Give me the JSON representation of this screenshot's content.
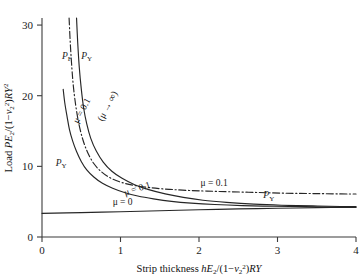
{
  "chart_data": {
    "type": "line",
    "title": "",
    "xlabel": "Strip thickness hE2/(1−ν2²)RY",
    "ylabel": "Load PE2/(1−ν2²)RY²",
    "xlim": [
      0,
      4
    ],
    "ylim": [
      0,
      31
    ],
    "xticks": [
      0,
      1,
      2,
      3,
      4
    ],
    "xtick_labels": [
      "0",
      "1",
      "2",
      "3",
      "4"
    ],
    "yticks": [
      0,
      10,
      20,
      30
    ],
    "ytick_labels": [
      "0",
      "10",
      "20",
      "30"
    ],
    "grid": false,
    "legend": "none",
    "series": [
      {
        "name": "PF (mu = 0.1)",
        "style": "dash-dot",
        "label": "P_F",
        "annotation": "μ = 0.1",
        "points": [
          [
            0.345,
            31.0
          ],
          [
            0.36,
            27.5
          ],
          [
            0.38,
            24.0
          ],
          [
            0.4,
            21.3
          ],
          [
            0.43,
            18.6
          ],
          [
            0.47,
            16.0
          ],
          [
            0.52,
            13.8
          ],
          [
            0.58,
            12.0
          ],
          [
            0.66,
            10.4
          ],
          [
            0.76,
            9.2
          ],
          [
            0.88,
            8.3
          ],
          [
            1.02,
            7.7
          ],
          [
            1.2,
            7.25
          ],
          [
            1.4,
            6.95
          ],
          [
            1.62,
            6.75
          ],
          [
            1.85,
            6.6
          ],
          [
            2.1,
            6.5
          ],
          [
            2.4,
            6.4
          ],
          [
            2.75,
            6.3
          ],
          [
            3.1,
            6.2
          ],
          [
            3.45,
            6.15
          ],
          [
            3.8,
            6.1
          ],
          [
            4.0,
            6.08
          ]
        ]
      },
      {
        "name": "PY (mu -> infinity)",
        "style": "solid",
        "label": "P_Y",
        "annotation": "(μ → ∞)",
        "points": [
          [
            0.44,
            31.0
          ],
          [
            0.455,
            27.5
          ],
          [
            0.475,
            24.0
          ],
          [
            0.5,
            21.0
          ],
          [
            0.53,
            18.3
          ],
          [
            0.57,
            16.0
          ],
          [
            0.62,
            14.0
          ],
          [
            0.69,
            12.2
          ],
          [
            0.78,
            10.6
          ],
          [
            0.89,
            9.3
          ],
          [
            1.02,
            8.3
          ],
          [
            1.18,
            7.4
          ],
          [
            1.36,
            6.7
          ],
          [
            1.57,
            6.1
          ],
          [
            1.8,
            5.6
          ],
          [
            2.05,
            5.2
          ],
          [
            2.35,
            4.9
          ],
          [
            2.7,
            4.65
          ],
          [
            3.05,
            4.5
          ],
          [
            3.45,
            4.4
          ],
          [
            3.8,
            4.32
          ],
          [
            4.0,
            4.3
          ]
        ]
      },
      {
        "name": "PY (mu = 0.1)",
        "style": "solid",
        "label": "P_Y",
        "annotation": "μ = 0.1",
        "points": [
          [
            0.27,
            20.9
          ],
          [
            0.29,
            19.0
          ],
          [
            0.32,
            17.0
          ],
          [
            0.35,
            15.2
          ],
          [
            0.39,
            13.6
          ],
          [
            0.44,
            12.1
          ],
          [
            0.5,
            10.7
          ],
          [
            0.57,
            9.5
          ],
          [
            0.66,
            8.5
          ],
          [
            0.77,
            7.6
          ],
          [
            0.9,
            6.9
          ],
          [
            1.05,
            6.3
          ],
          [
            1.22,
            5.8
          ],
          [
            1.42,
            5.4
          ],
          [
            1.65,
            5.05
          ],
          [
            1.9,
            4.8
          ],
          [
            2.2,
            4.6
          ],
          [
            2.55,
            4.45
          ],
          [
            2.95,
            4.35
          ],
          [
            3.35,
            4.3
          ],
          [
            3.75,
            4.25
          ],
          [
            4.0,
            4.23
          ]
        ]
      },
      {
        "name": "PY (mu = 0)",
        "style": "solid",
        "label": "P_Y",
        "annotation": "μ = 0",
        "points": [
          [
            0.0,
            3.35
          ],
          [
            0.5,
            3.45
          ],
          [
            1.0,
            3.58
          ],
          [
            1.5,
            3.72
          ],
          [
            2.0,
            3.86
          ],
          [
            2.5,
            3.98
          ],
          [
            3.0,
            4.07
          ],
          [
            3.5,
            4.15
          ],
          [
            4.0,
            4.2
          ]
        ]
      }
    ],
    "annotations": [
      {
        "name": "label-PF-top",
        "text": "P",
        "sub": "F",
        "x": 0.255,
        "y": 25.2
      },
      {
        "name": "label-PY-top",
        "text": "P",
        "sub": "Y",
        "x": 0.5,
        "y": 25.2
      },
      {
        "name": "label-PY-left",
        "text": "P",
        "sub": "Y",
        "x": 0.175,
        "y": 10.1
      },
      {
        "name": "label-PY-right",
        "text": "P",
        "sub": "Y",
        "x": 2.82,
        "y": 5.45
      },
      {
        "name": "label-mu-01-rot-left",
        "text": "μ = 0.1",
        "x": 0.46,
        "y": 16.0,
        "rotate": -62
      },
      {
        "name": "label-mu-inf-rot",
        "text": "(μ → ∞)",
        "x": 0.77,
        "y": 16.3,
        "rotate": -62
      },
      {
        "name": "label-mu-01-mid",
        "text": "μ = 0.1",
        "x": 1.06,
        "y": 5.85,
        "rotate": -18
      },
      {
        "name": "label-mu-01-right",
        "text": "μ = 0.1",
        "x": 2.02,
        "y": 7.2
      },
      {
        "name": "label-mu-0",
        "text": "μ = 0",
        "x": 0.9,
        "y": 4.55
      }
    ]
  },
  "axes": {
    "x_label_parts": {
      "prefix": "Strip thickness ",
      "h": "h",
      "E": "E",
      "E_sub": "2",
      "mid": "/(1−",
      "nu": "ν",
      "nu_sub": "2",
      "nu_sup": "2",
      "close": ")",
      "R": "R",
      "Y": "Y"
    },
    "y_label_parts": {
      "prefix": "Load ",
      "P": "P",
      "E": "E",
      "E_sub": "2",
      "mid": "/(1−",
      "nu": "ν",
      "nu_sub": "2",
      "nu_sup": "2",
      "close": ")",
      "R": "R",
      "Y": "Y",
      "Y_sup": "2"
    }
  },
  "colors": {
    "axis": "#3b3b3b",
    "curve": "#262626",
    "text": "#111111",
    "background": "#ffffff"
  }
}
